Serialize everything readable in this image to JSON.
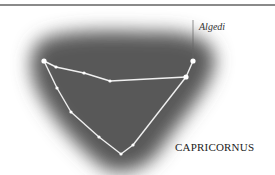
{
  "figure": {
    "constellation_name": "CAPRICORNUS",
    "star_label": "Algedi",
    "colors": {
      "background": "#ffffff",
      "sky": "#555555",
      "lines": "#f2f2f2",
      "stars": "#ffffff",
      "rule": "#8a8a8a",
      "text": "#222222"
    }
  },
  "chart_data": {
    "type": "diagram",
    "title": "CAPRICORNUS",
    "stars": [
      {
        "id": "s1",
        "x": 44,
        "y": 61,
        "size": "large"
      },
      {
        "id": "s2",
        "x": 56,
        "y": 67,
        "size": "small"
      },
      {
        "id": "s3",
        "x": 84,
        "y": 73,
        "size": "small"
      },
      {
        "id": "s4",
        "x": 110,
        "y": 81,
        "size": "small"
      },
      {
        "id": "s5",
        "x": 186,
        "y": 77,
        "size": "large"
      },
      {
        "id": "algedi",
        "x": 193,
        "y": 61,
        "size": "large",
        "label": "Algedi"
      },
      {
        "id": "s7",
        "x": 57,
        "y": 88,
        "size": "small"
      },
      {
        "id": "s8",
        "x": 71,
        "y": 112,
        "size": "small"
      },
      {
        "id": "s9",
        "x": 99,
        "y": 137,
        "size": "small"
      },
      {
        "id": "s10",
        "x": 121,
        "y": 154,
        "size": "small"
      },
      {
        "id": "s11",
        "x": 133,
        "y": 145,
        "size": "small"
      }
    ],
    "edges": [
      [
        "s1",
        "s2"
      ],
      [
        "s2",
        "s3"
      ],
      [
        "s3",
        "s4"
      ],
      [
        "s4",
        "s5"
      ],
      [
        "s5",
        "algedi"
      ],
      [
        "s1",
        "s7"
      ],
      [
        "s7",
        "s8"
      ],
      [
        "s8",
        "s9"
      ],
      [
        "s9",
        "s10"
      ],
      [
        "s10",
        "s11"
      ],
      [
        "s11",
        "s5"
      ]
    ],
    "annotations": [
      {
        "text": "Algedi",
        "target": "algedi",
        "leader_line": true
      },
      {
        "text": "CAPRICORNUS",
        "position": "bottom-right"
      }
    ]
  }
}
